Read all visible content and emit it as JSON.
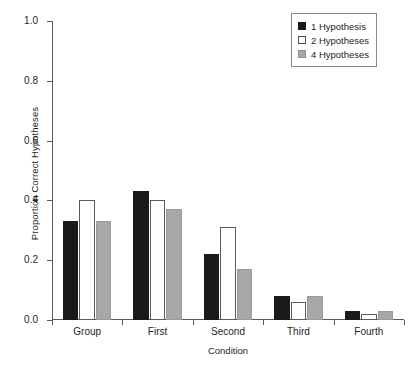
{
  "chart_data": {
    "type": "bar",
    "title": "",
    "xlabel": "Condition",
    "ylabel": "Proportion Correct Hypotheses",
    "categories": [
      "Group",
      "First",
      "Second",
      "Third",
      "Fourth"
    ],
    "series": [
      {
        "name": "1 Hypothesis",
        "color": "#1a1a1a",
        "values": [
          0.33,
          0.43,
          0.22,
          0.08,
          0.03
        ]
      },
      {
        "name": "2 Hypotheses",
        "color": "#ffffff",
        "values": [
          0.4,
          0.4,
          0.31,
          0.06,
          0.02
        ]
      },
      {
        "name": "4 Hypotheses",
        "color": "#a8a8a8",
        "values": [
          0.33,
          0.37,
          0.17,
          0.08,
          0.03
        ]
      }
    ],
    "ylim": [
      0.0,
      1.0
    ],
    "yticks": [
      0.0,
      0.2,
      0.4,
      0.6,
      0.8,
      1.0
    ],
    "ytick_labels": [
      "0.0",
      "0.2",
      "0.4",
      "0.6",
      "0.8",
      "1.0"
    ],
    "grid": false,
    "legend_position": "top-right"
  }
}
